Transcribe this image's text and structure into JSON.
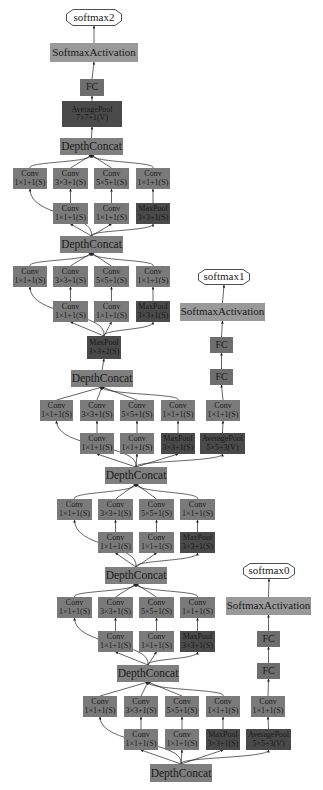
{
  "diagram": {
    "type": "neural-network-graph",
    "colors": {
      "conv": "#7a7a7a",
      "pool": "#4a4a4a",
      "concat": "#7f7f7f",
      "activation": "#999999",
      "fc": "#6e6e6e",
      "output": "#ffffff",
      "edge": "#222222"
    },
    "nodes": [
      {
        "id": "softmax2",
        "kind": "out",
        "lines": [
          "softmax2"
        ],
        "x": 66,
        "y": 9,
        "w": 56,
        "h": 17
      },
      {
        "id": "act2",
        "kind": "act",
        "lines": [
          "SoftmaxActivation"
        ],
        "x": 50,
        "y": 43,
        "w": 88,
        "h": 19
      },
      {
        "id": "fc2",
        "kind": "fc",
        "lines": [
          "FC"
        ],
        "x": 80,
        "y": 79,
        "w": 24,
        "h": 17
      },
      {
        "id": "avgpool2",
        "kind": "pool",
        "lines": [
          "AveragePool",
          "7×7+1(V)"
        ],
        "x": 62,
        "y": 101,
        "w": 60,
        "h": 26
      },
      {
        "id": "dc9",
        "kind": "concat",
        "lines": [
          "DepthConcat"
        ],
        "x": 60,
        "y": 138,
        "w": 63,
        "h": 17
      },
      {
        "id": "c9a",
        "kind": "conv",
        "lines": [
          "Conv",
          "1×1+1(S)"
        ],
        "x": 13,
        "y": 168,
        "w": 34,
        "h": 21
      },
      {
        "id": "c9b",
        "kind": "conv",
        "lines": [
          "Conv",
          "3×3+1(S)"
        ],
        "x": 53,
        "y": 168,
        "w": 35,
        "h": 21
      },
      {
        "id": "c9c",
        "kind": "conv",
        "lines": [
          "Conv",
          "5×5+1(S)"
        ],
        "x": 94,
        "y": 168,
        "w": 35,
        "h": 21
      },
      {
        "id": "c9d",
        "kind": "conv",
        "lines": [
          "Conv",
          "1×1+1(S)"
        ],
        "x": 136,
        "y": 168,
        "w": 34,
        "h": 21
      },
      {
        "id": "c9e",
        "kind": "conv",
        "lines": [
          "Conv",
          "1×1+1(S)"
        ],
        "x": 53,
        "y": 203,
        "w": 35,
        "h": 21
      },
      {
        "id": "c9f",
        "kind": "conv",
        "lines": [
          "Conv",
          "1×1+1(S)"
        ],
        "x": 94,
        "y": 203,
        "w": 35,
        "h": 21
      },
      {
        "id": "mp9",
        "kind": "pool",
        "lines": [
          "MaxPool",
          "3×3+1(S)"
        ],
        "x": 136,
        "y": 203,
        "w": 34,
        "h": 21
      },
      {
        "id": "dc8",
        "kind": "concat",
        "lines": [
          "DepthConcat"
        ],
        "x": 60,
        "y": 236,
        "w": 63,
        "h": 17
      },
      {
        "id": "c8a",
        "kind": "conv",
        "lines": [
          "Conv",
          "1×1+1(S)"
        ],
        "x": 13,
        "y": 266,
        "w": 34,
        "h": 21
      },
      {
        "id": "c8b",
        "kind": "conv",
        "lines": [
          "Conv",
          "3×3+1(S)"
        ],
        "x": 53,
        "y": 266,
        "w": 35,
        "h": 21
      },
      {
        "id": "c8c",
        "kind": "conv",
        "lines": [
          "Conv",
          "5×5+1(S)"
        ],
        "x": 94,
        "y": 266,
        "w": 35,
        "h": 21
      },
      {
        "id": "c8d",
        "kind": "conv",
        "lines": [
          "Conv",
          "1×1+1(S)"
        ],
        "x": 136,
        "y": 266,
        "w": 34,
        "h": 21
      },
      {
        "id": "c8e",
        "kind": "conv",
        "lines": [
          "Conv",
          "1×1+1(S)"
        ],
        "x": 53,
        "y": 301,
        "w": 35,
        "h": 21
      },
      {
        "id": "c8f",
        "kind": "conv",
        "lines": [
          "Conv",
          "1×1+1(S)"
        ],
        "x": 94,
        "y": 301,
        "w": 35,
        "h": 21
      },
      {
        "id": "mp8",
        "kind": "pool",
        "lines": [
          "MaxPool",
          "3×3+1(S)"
        ],
        "x": 136,
        "y": 301,
        "w": 34,
        "h": 21
      },
      {
        "id": "mpA",
        "kind": "pool",
        "lines": [
          "MaxPool",
          "3×3+2(S)"
        ],
        "x": 87,
        "y": 336,
        "w": 34,
        "h": 23
      },
      {
        "id": "softmax1",
        "kind": "out",
        "lines": [
          "softmax1"
        ],
        "x": 198,
        "y": 269,
        "w": 52,
        "h": 16
      },
      {
        "id": "act1",
        "kind": "act",
        "lines": [
          "SoftmaxActivation"
        ],
        "x": 180,
        "y": 303,
        "w": 85,
        "h": 18
      },
      {
        "id": "fc1a",
        "kind": "fc",
        "lines": [
          "FC"
        ],
        "x": 210,
        "y": 337,
        "w": 23,
        "h": 16
      },
      {
        "id": "fc1b",
        "kind": "fc",
        "lines": [
          "FC"
        ],
        "x": 210,
        "y": 369,
        "w": 23,
        "h": 16
      },
      {
        "id": "dc7",
        "kind": "concat",
        "lines": [
          "DepthConcat"
        ],
        "x": 71,
        "y": 370,
        "w": 62,
        "h": 17
      },
      {
        "id": "c7a",
        "kind": "conv",
        "lines": [
          "Conv",
          "1×1+1(S)"
        ],
        "x": 40,
        "y": 400,
        "w": 33,
        "h": 21
      },
      {
        "id": "c7b",
        "kind": "conv",
        "lines": [
          "Conv",
          "3×3+1(S)"
        ],
        "x": 80,
        "y": 400,
        "w": 34,
        "h": 21
      },
      {
        "id": "c7c",
        "kind": "conv",
        "lines": [
          "Conv",
          "5×5+1(S)"
        ],
        "x": 120,
        "y": 400,
        "w": 34,
        "h": 21
      },
      {
        "id": "c7d",
        "kind": "conv",
        "lines": [
          "Conv",
          "1×1+1(S)"
        ],
        "x": 161,
        "y": 400,
        "w": 34,
        "h": 21
      },
      {
        "id": "c7aux",
        "kind": "conv",
        "lines": [
          "Conv",
          "1×1+1(S)"
        ],
        "x": 206,
        "y": 400,
        "w": 34,
        "h": 21
      },
      {
        "id": "c7e",
        "kind": "conv",
        "lines": [
          "Conv",
          "1×1+1(S)"
        ],
        "x": 80,
        "y": 433,
        "w": 34,
        "h": 21
      },
      {
        "id": "c7f",
        "kind": "conv",
        "lines": [
          "Conv",
          "1×1+1(S)"
        ],
        "x": 120,
        "y": 433,
        "w": 34,
        "h": 21
      },
      {
        "id": "mp7",
        "kind": "pool",
        "lines": [
          "MaxPool",
          "3×3+1(S)"
        ],
        "x": 161,
        "y": 433,
        "w": 34,
        "h": 21
      },
      {
        "id": "ap1",
        "kind": "pool",
        "lines": [
          "AveragePool",
          "5×5+3(V)"
        ],
        "x": 200,
        "y": 433,
        "w": 45,
        "h": 21
      },
      {
        "id": "dc6",
        "kind": "concat",
        "lines": [
          "DepthConcat"
        ],
        "x": 105,
        "y": 467,
        "w": 62,
        "h": 17
      },
      {
        "id": "c6a",
        "kind": "conv",
        "lines": [
          "Conv",
          "1×1+1(S)"
        ],
        "x": 57,
        "y": 499,
        "w": 35,
        "h": 21
      },
      {
        "id": "c6b",
        "kind": "conv",
        "lines": [
          "Conv",
          "3×3+1(S)"
        ],
        "x": 98,
        "y": 499,
        "w": 35,
        "h": 21
      },
      {
        "id": "c6c",
        "kind": "conv",
        "lines": [
          "Conv",
          "5×5+1(S)"
        ],
        "x": 139,
        "y": 499,
        "w": 35,
        "h": 21
      },
      {
        "id": "c6d",
        "kind": "conv",
        "lines": [
          "Conv",
          "1×1+1(S)"
        ],
        "x": 180,
        "y": 499,
        "w": 35,
        "h": 21
      },
      {
        "id": "c6e",
        "kind": "conv",
        "lines": [
          "Conv",
          "1×1+1(S)"
        ],
        "x": 98,
        "y": 532,
        "w": 35,
        "h": 21
      },
      {
        "id": "c6f",
        "kind": "conv",
        "lines": [
          "Conv",
          "1×1+1(S)"
        ],
        "x": 139,
        "y": 532,
        "w": 35,
        "h": 21
      },
      {
        "id": "mp6",
        "kind": "pool",
        "lines": [
          "MaxPool",
          "3×3+1(S)"
        ],
        "x": 180,
        "y": 532,
        "w": 35,
        "h": 21
      },
      {
        "id": "dc5",
        "kind": "concat",
        "lines": [
          "DepthConcat"
        ],
        "x": 105,
        "y": 567,
        "w": 62,
        "h": 17
      },
      {
        "id": "c5a",
        "kind": "conv",
        "lines": [
          "Conv",
          "1×1+1(S)"
        ],
        "x": 57,
        "y": 597,
        "w": 35,
        "h": 21
      },
      {
        "id": "c5b",
        "kind": "conv",
        "lines": [
          "Conv",
          "3×3+1(S)"
        ],
        "x": 98,
        "y": 597,
        "w": 35,
        "h": 21
      },
      {
        "id": "c5c",
        "kind": "conv",
        "lines": [
          "Conv",
          "5×5+1(S)"
        ],
        "x": 139,
        "y": 597,
        "w": 35,
        "h": 21
      },
      {
        "id": "c5d",
        "kind": "conv",
        "lines": [
          "Conv",
          "1×1+1(S)"
        ],
        "x": 180,
        "y": 597,
        "w": 35,
        "h": 21
      },
      {
        "id": "c5e",
        "kind": "conv",
        "lines": [
          "Conv",
          "1×1+1(S)"
        ],
        "x": 98,
        "y": 631,
        "w": 35,
        "h": 21
      },
      {
        "id": "c5f",
        "kind": "conv",
        "lines": [
          "Conv",
          "1×1+1(S)"
        ],
        "x": 139,
        "y": 631,
        "w": 35,
        "h": 21
      },
      {
        "id": "mp5",
        "kind": "pool",
        "lines": [
          "MaxPool",
          "3×3+1(S)"
        ],
        "x": 180,
        "y": 631,
        "w": 35,
        "h": 21
      },
      {
        "id": "softmax0",
        "kind": "out",
        "lines": [
          "softmax0"
        ],
        "x": 243,
        "y": 563,
        "w": 52,
        "h": 16
      },
      {
        "id": "act0",
        "kind": "act",
        "lines": [
          "SoftmaxActivation"
        ],
        "x": 226,
        "y": 597,
        "w": 85,
        "h": 18
      },
      {
        "id": "fc0a",
        "kind": "fc",
        "lines": [
          "FC"
        ],
        "x": 257,
        "y": 631,
        "w": 23,
        "h": 16
      },
      {
        "id": "fc0b",
        "kind": "fc",
        "lines": [
          "FC"
        ],
        "x": 257,
        "y": 663,
        "w": 23,
        "h": 16
      },
      {
        "id": "dc4",
        "kind": "concat",
        "lines": [
          "DepthConcat"
        ],
        "x": 117,
        "y": 665,
        "w": 62,
        "h": 17
      },
      {
        "id": "c4a",
        "kind": "conv",
        "lines": [
          "Conv",
          "1×1+1(S)"
        ],
        "x": 83,
        "y": 696,
        "w": 34,
        "h": 21
      },
      {
        "id": "c4b",
        "kind": "conv",
        "lines": [
          "Conv",
          "3×3+1(S)"
        ],
        "x": 124,
        "y": 696,
        "w": 34,
        "h": 21
      },
      {
        "id": "c4c",
        "kind": "conv",
        "lines": [
          "Conv",
          "5×5+1(S)"
        ],
        "x": 165,
        "y": 696,
        "w": 34,
        "h": 21
      },
      {
        "id": "c4d",
        "kind": "conv",
        "lines": [
          "Conv",
          "1×1+1(S)"
        ],
        "x": 206,
        "y": 696,
        "w": 34,
        "h": 21
      },
      {
        "id": "c4aux",
        "kind": "conv",
        "lines": [
          "Conv",
          "1×1+1(S)"
        ],
        "x": 251,
        "y": 696,
        "w": 34,
        "h": 21
      },
      {
        "id": "c4e",
        "kind": "conv",
        "lines": [
          "Conv",
          "1×1+1(S)"
        ],
        "x": 124,
        "y": 729,
        "w": 34,
        "h": 21
      },
      {
        "id": "c4f",
        "kind": "conv",
        "lines": [
          "Conv",
          "1×1+1(S)"
        ],
        "x": 165,
        "y": 729,
        "w": 34,
        "h": 21
      },
      {
        "id": "mp4",
        "kind": "pool",
        "lines": [
          "MaxPool",
          "3×3+1(S)"
        ],
        "x": 206,
        "y": 729,
        "w": 34,
        "h": 21
      },
      {
        "id": "ap0",
        "kind": "pool",
        "lines": [
          "AveragePool",
          "5×5+3(V)"
        ],
        "x": 246,
        "y": 729,
        "w": 45,
        "h": 21
      },
      {
        "id": "dc3",
        "kind": "concat",
        "lines": [
          "DepthConcat"
        ],
        "x": 150,
        "y": 764,
        "w": 62,
        "h": 18
      }
    ],
    "edges": [
      [
        "avgpool2",
        "fc2"
      ],
      [
        "fc2",
        "act2"
      ],
      [
        "act2",
        "softmax2"
      ],
      [
        "dc9",
        "avgpool2"
      ],
      [
        "c9a",
        "dc9"
      ],
      [
        "c9b",
        "dc9"
      ],
      [
        "c9c",
        "dc9"
      ],
      [
        "c9d",
        "dc9"
      ],
      [
        "c9e",
        "c9b"
      ],
      [
        "c9f",
        "c9c"
      ],
      [
        "mp9",
        "c9d"
      ],
      [
        "dc8",
        "c9a"
      ],
      [
        "dc8",
        "c9e"
      ],
      [
        "dc8",
        "c9f"
      ],
      [
        "dc8",
        "mp9"
      ],
      [
        "c8a",
        "dc8"
      ],
      [
        "c8b",
        "dc8"
      ],
      [
        "c8c",
        "dc8"
      ],
      [
        "c8d",
        "dc8"
      ],
      [
        "c8e",
        "c8b"
      ],
      [
        "c8f",
        "c8c"
      ],
      [
        "mp8",
        "c8d"
      ],
      [
        "mpA",
        "c8a"
      ],
      [
        "mpA",
        "c8e"
      ],
      [
        "mpA",
        "c8f"
      ],
      [
        "mpA",
        "mp8"
      ],
      [
        "dc7",
        "mpA"
      ],
      [
        "fc1b",
        "fc1a"
      ],
      [
        "fc1a",
        "act1"
      ],
      [
        "act1",
        "softmax1"
      ],
      [
        "c7aux",
        "fc1b"
      ],
      [
        "ap1",
        "c7aux"
      ],
      [
        "c7a",
        "dc7"
      ],
      [
        "c7b",
        "dc7"
      ],
      [
        "c7c",
        "dc7"
      ],
      [
        "c7d",
        "dc7"
      ],
      [
        "c7e",
        "c7b"
      ],
      [
        "c7f",
        "c7c"
      ],
      [
        "mp7",
        "c7d"
      ],
      [
        "dc6",
        "c7a"
      ],
      [
        "dc6",
        "c7e"
      ],
      [
        "dc6",
        "c7f"
      ],
      [
        "dc6",
        "mp7"
      ],
      [
        "dc6",
        "ap1"
      ],
      [
        "c6a",
        "dc6"
      ],
      [
        "c6b",
        "dc6"
      ],
      [
        "c6c",
        "dc6"
      ],
      [
        "c6d",
        "dc6"
      ],
      [
        "c6e",
        "c6b"
      ],
      [
        "c6f",
        "c6c"
      ],
      [
        "mp6",
        "c6d"
      ],
      [
        "dc5",
        "c6a"
      ],
      [
        "dc5",
        "c6e"
      ],
      [
        "dc5",
        "c6f"
      ],
      [
        "dc5",
        "mp6"
      ],
      [
        "c5a",
        "dc5"
      ],
      [
        "c5b",
        "dc5"
      ],
      [
        "c5c",
        "dc5"
      ],
      [
        "c5d",
        "dc5"
      ],
      [
        "c5e",
        "c5b"
      ],
      [
        "c5f",
        "c5c"
      ],
      [
        "mp5",
        "c5d"
      ],
      [
        "dc4",
        "c5a"
      ],
      [
        "dc4",
        "c5e"
      ],
      [
        "dc4",
        "c5f"
      ],
      [
        "dc4",
        "mp5"
      ],
      [
        "fc0b",
        "fc0a"
      ],
      [
        "fc0a",
        "act0"
      ],
      [
        "act0",
        "softmax0"
      ],
      [
        "c4aux",
        "fc0b"
      ],
      [
        "ap0",
        "c4aux"
      ],
      [
        "c4a",
        "dc4"
      ],
      [
        "c4b",
        "dc4"
      ],
      [
        "c4c",
        "dc4"
      ],
      [
        "c4d",
        "dc4"
      ],
      [
        "c4e",
        "c4b"
      ],
      [
        "c4f",
        "c4c"
      ],
      [
        "mp4",
        "c4d"
      ],
      [
        "dc3",
        "c4a"
      ],
      [
        "dc3",
        "c4e"
      ],
      [
        "dc3",
        "c4f"
      ],
      [
        "dc3",
        "mp4"
      ],
      [
        "dc3",
        "ap0"
      ]
    ]
  }
}
